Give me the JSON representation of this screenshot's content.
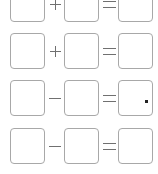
{
  "worksheet": {
    "rows": [
      {
        "operand1": "",
        "operator": "+",
        "operand2": "",
        "equals": "=",
        "result": "",
        "result_mark": false
      },
      {
        "operand1": "",
        "operator": "+",
        "operand2": "",
        "equals": "=",
        "result": "",
        "result_mark": false
      },
      {
        "operand1": "",
        "operator": "−",
        "operand2": "",
        "equals": "=",
        "result": "",
        "result_mark": true
      },
      {
        "operand1": "",
        "operator": "−",
        "operand2": "",
        "equals": "=",
        "result": "",
        "result_mark": false
      }
    ]
  },
  "colors": {
    "box_border": "#a8a8a8",
    "symbol": "#707070",
    "mark": "#222222"
  }
}
